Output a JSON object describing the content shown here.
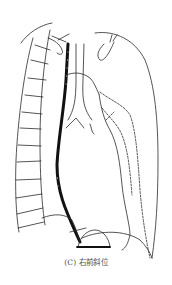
{
  "figure": {
    "caption": "(C) 右前斜位",
    "view": "right anterior oblique",
    "colors": {
      "line": "#2a2a2a",
      "esophagus": "#111111",
      "caption": "#555555",
      "background": "#ffffff"
    },
    "structures": [
      "spine-with-ribs",
      "esophagus-barium",
      "trachea",
      "aortic-arch",
      "heart-border",
      "heart-dashed-contour",
      "diaphragm",
      "gastric-fundus"
    ]
  }
}
